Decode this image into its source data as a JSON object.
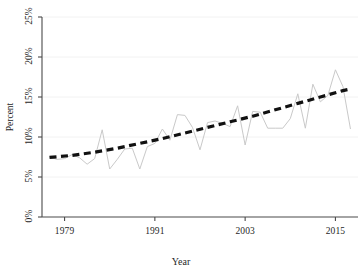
{
  "chart_data": {
    "type": "line",
    "title": "",
    "xlabel": "Year",
    "ylabel": "Percent",
    "xlim": [
      1976,
      2018
    ],
    "ylim": [
      0,
      25
    ],
    "grid": true,
    "grid_axis": "y",
    "legend": "none",
    "xticks": [
      1979,
      1991,
      2003,
      2015
    ],
    "xtick_labels": [
      "1979",
      "1991",
      "2003",
      "2015"
    ],
    "yticks": [
      0,
      5,
      10,
      15,
      20,
      25
    ],
    "ytick_labels": [
      "0%",
      "5%",
      "10%",
      "15%",
      "20%",
      "25%"
    ],
    "series": [
      {
        "name": "Observed percent",
        "style": "solid",
        "color": "#c9c9c9",
        "width": 1,
        "x": [
          1977,
          1978,
          1979,
          1980,
          1981,
          1982,
          1983,
          1984,
          1985,
          1986,
          1987,
          1988,
          1989,
          1990,
          1991,
          1992,
          1993,
          1994,
          1995,
          1996,
          1997,
          1998,
          1999,
          2000,
          2001,
          2002,
          2003,
          2004,
          2005,
          2006,
          2007,
          2008,
          2009,
          2010,
          2011,
          2012,
          2013,
          2014,
          2015,
          2016,
          2017
        ],
        "values": [
          7.5,
          7.2,
          7.3,
          7.8,
          7.4,
          6.6,
          7.3,
          10.9,
          6.0,
          7.2,
          8.5,
          8.6,
          6.0,
          8.8,
          9.2,
          11.0,
          9.6,
          12.8,
          12.7,
          11.2,
          8.4,
          11.8,
          12.0,
          11.7,
          11.3,
          13.9,
          9.0,
          13.2,
          13.1,
          11.1,
          11.1,
          11.1,
          12.3,
          15.4,
          11.1,
          16.6,
          14.4,
          15.2,
          18.4,
          16.3,
          11.0
        ]
      },
      {
        "name": "Fitted trend",
        "style": "dashed",
        "color": "#111111",
        "width": 3.2,
        "x": [
          1977,
          1980,
          1983,
          1986,
          1989,
          1992,
          1995,
          1998,
          2001,
          2004,
          2007,
          2010,
          2013,
          2016,
          2017
        ],
        "values": [
          7.45,
          7.7,
          8.1,
          8.6,
          9.2,
          9.8,
          10.5,
          11.2,
          11.9,
          12.6,
          13.4,
          14.2,
          15.0,
          15.8,
          16.0
        ]
      }
    ]
  },
  "axes": {
    "y_axis_label": "Percent",
    "x_axis_label": "Year"
  },
  "colors": {
    "series_line": "#c9c9c9",
    "trend_line": "#111111",
    "gridline": "#f2f2f2",
    "axis": "#4a4a4a",
    "background": "#ffffff"
  }
}
